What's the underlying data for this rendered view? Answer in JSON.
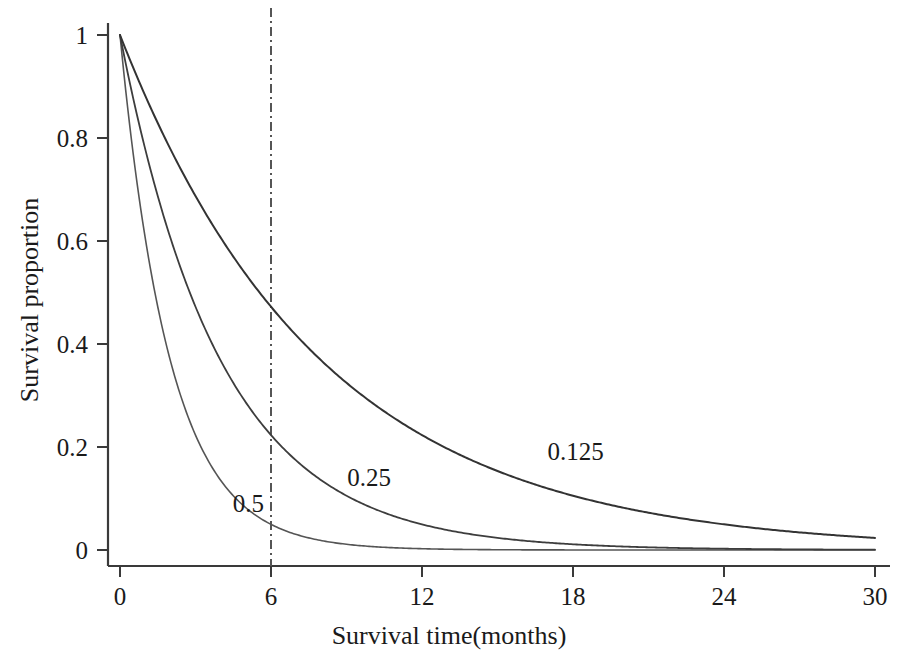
{
  "chart_data": {
    "type": "line",
    "title": "",
    "xlabel": "Survival time(months)",
    "ylabel": "Survival proportion",
    "xlim": [
      0,
      30
    ],
    "ylim": [
      0,
      1
    ],
    "xticks": [
      "0",
      "6",
      "12",
      "18",
      "24",
      "30"
    ],
    "xtick_values": [
      0,
      6,
      12,
      18,
      24,
      30
    ],
    "yticks": [
      "0",
      "0.2",
      "0.4",
      "0.6",
      "0.8",
      "1"
    ],
    "ytick_values": [
      0,
      0.2,
      0.4,
      0.6,
      0.8,
      1
    ],
    "grid": false,
    "legend": "inline-curve-labels",
    "model": "exponential survival S(t) = exp(-lambda*t)",
    "annotations": [
      {
        "name": "reference-line",
        "style": "dash-dot vertical",
        "x": 6,
        "label": ""
      }
    ],
    "series": [
      {
        "name": "0.5",
        "label": "0.5",
        "lambda": 0.5,
        "color": "#555555",
        "linewidth": 1.6,
        "label_x": 5.1,
        "label_y": 0.091,
        "x": [
          0,
          0.5,
          1,
          1.5,
          2,
          2.5,
          3,
          3.5,
          4,
          4.5,
          5,
          5.5,
          6,
          7,
          8,
          9,
          10,
          12,
          14,
          16,
          18,
          20,
          22,
          24,
          26,
          28,
          30
        ],
        "y": [
          1,
          0.779,
          0.607,
          0.472,
          0.368,
          0.287,
          0.223,
          0.174,
          0.135,
          0.105,
          0.082,
          0.064,
          0.05,
          0.03,
          0.018,
          0.011,
          0.0067,
          0.0025,
          0.0009,
          0.0003,
          0.0001,
          5e-05,
          2e-05,
          6e-06,
          2e-06,
          8e-07,
          3e-07
        ]
      },
      {
        "name": "0.25",
        "label": "0.25",
        "lambda": 0.25,
        "color": "#3d3d3d",
        "linewidth": 1.8,
        "label_x": 9.9,
        "label_y": 0.142,
        "x": [
          0,
          0.5,
          1,
          1.5,
          2,
          3,
          4,
          5,
          6,
          7,
          8,
          9,
          10,
          12,
          14,
          16,
          18,
          20,
          22,
          24,
          26,
          28,
          30
        ],
        "y": [
          1,
          0.882,
          0.779,
          0.687,
          0.607,
          0.472,
          0.368,
          0.287,
          0.223,
          0.174,
          0.135,
          0.105,
          0.082,
          0.05,
          0.03,
          0.018,
          0.011,
          0.0067,
          0.0041,
          0.0025,
          0.0015,
          0.0009,
          0.00055
        ]
      },
      {
        "name": "0.125",
        "label": "0.125",
        "lambda": 0.125,
        "color": "#333333",
        "linewidth": 2.0,
        "label_x": 18.1,
        "label_y": 0.192,
        "x": [
          0,
          1,
          2,
          3,
          4,
          5,
          6,
          7,
          8,
          9,
          10,
          12,
          14,
          16,
          18,
          20,
          22,
          24,
          26,
          28,
          30
        ],
        "y": [
          1,
          0.882,
          0.779,
          0.687,
          0.607,
          0.535,
          0.472,
          0.417,
          0.368,
          0.325,
          0.287,
          0.223,
          0.174,
          0.135,
          0.105,
          0.082,
          0.064,
          0.05,
          0.039,
          0.03,
          0.0235
        ]
      }
    ]
  },
  "geometry": {
    "plot_left": 120,
    "plot_right": 875,
    "plot_top": 35,
    "plot_bottom": 550,
    "axis_x_line_y": 566,
    "axis_y_line_x": 108,
    "axis_color": "#3a3a3a"
  }
}
